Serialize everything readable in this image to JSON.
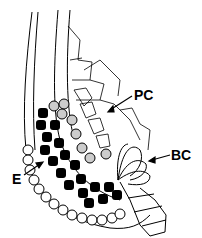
{
  "diagram": {
    "labels": [
      {
        "id": "PC",
        "text": "PC"
      },
      {
        "id": "BC",
        "text": "BC"
      },
      {
        "id": "E",
        "text": "E"
      }
    ],
    "colors": {
      "line": "#000000",
      "background": "#ffffff",
      "stipple": "#888888"
    }
  }
}
